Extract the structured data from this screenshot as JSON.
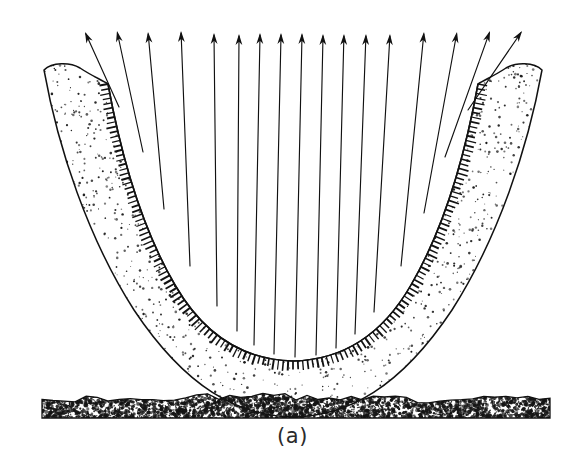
{
  "figure": {
    "label": "(a)",
    "kind": "line-drawing cross-section",
    "background_color": "#ffffff",
    "ink_color": "#111111",
    "stipple_color": "#1a1a1a",
    "ground_color": "#151515",
    "canvas": {
      "width": 587,
      "height": 466
    }
  },
  "geometry": {
    "inner_surface_path": "M 108 84 C 120 150 140 225 175 285 C 205 337 245 360 293 361 C 341 360 381 337 411 285 C 446 225 466 150 478 84",
    "outer_surface_path": "M 44 70 C 60 140 92 230 140 300 C 190 372 240 404 293 406 C 346 404 396 372 446 300 C 494 230 526 140 542 70",
    "body_outline_path": "M 44 70 C 52 62 70 62 80 68 C 92 76 102 80 108 84 C 120 150 140 225 175 285 C 205 337 245 360 293 361 C 341 360 381 337 411 285 C 446 225 466 150 478 84 C 484 80 494 76 506 68 C 516 62 534 62 542 70 C 528 148 498 238 452 310 C 400 388 348 416 293 417 C 238 416 186 388 134 310 C 88 238 58 148 44 70 Z",
    "ground_band": {
      "x_start": 42,
      "x_end": 550,
      "y_top": 398,
      "y_bottom": 418
    }
  },
  "arrows": {
    "count": 17,
    "direction": "upward, fanning outward from inner surface",
    "head_length": 11,
    "head_half_width": 3.4,
    "stroke_width": 1.15,
    "items": [
      {
        "tip_x": 85,
        "tip_y": 32,
        "tail_x": 119,
        "tail_y": 107
      },
      {
        "tip_x": 117,
        "tip_y": 31,
        "tail_x": 143,
        "tail_y": 152
      },
      {
        "tip_x": 148,
        "tip_y": 32,
        "tail_x": 164,
        "tail_y": 209
      },
      {
        "tip_x": 181,
        "tip_y": 31,
        "tail_x": 190,
        "tail_y": 266
      },
      {
        "tip_x": 214,
        "tip_y": 33,
        "tail_x": 217,
        "tail_y": 306
      },
      {
        "tip_x": 239,
        "tip_y": 34,
        "tail_x": 237,
        "tail_y": 331
      },
      {
        "tip_x": 260,
        "tip_y": 33,
        "tail_x": 254,
        "tail_y": 345
      },
      {
        "tip_x": 281,
        "tip_y": 33,
        "tail_x": 274,
        "tail_y": 354
      },
      {
        "tip_x": 302,
        "tip_y": 33,
        "tail_x": 295,
        "tail_y": 357
      },
      {
        "tip_x": 323,
        "tip_y": 34,
        "tail_x": 316,
        "tail_y": 355
      },
      {
        "tip_x": 344,
        "tip_y": 34,
        "tail_x": 336,
        "tail_y": 348
      },
      {
        "tip_x": 366,
        "tip_y": 34,
        "tail_x": 355,
        "tail_y": 334
      },
      {
        "tip_x": 390,
        "tip_y": 34,
        "tail_x": 374,
        "tail_y": 312
      },
      {
        "tip_x": 424,
        "tip_y": 32,
        "tail_x": 401,
        "tail_y": 266
      },
      {
        "tip_x": 457,
        "tip_y": 32,
        "tail_x": 424,
        "tail_y": 213
      },
      {
        "tip_x": 490,
        "tip_y": 31,
        "tail_x": 445,
        "tail_y": 157
      },
      {
        "tip_x": 522,
        "tip_y": 31,
        "tail_x": 468,
        "tail_y": 110
      }
    ]
  },
  "lining": {
    "description": "dark hatched band of short perpendicular ticks along the inner surface",
    "tick_count": 150,
    "tick_length": 9,
    "tick_stroke_width": 1.4,
    "band_color": "#121212"
  },
  "stipple": {
    "description": "random dot stipple filling the body between inner lining and outer boundary",
    "dot_count": 3400,
    "dot_radius_min": 0.5,
    "dot_radius_max": 1.35
  }
}
